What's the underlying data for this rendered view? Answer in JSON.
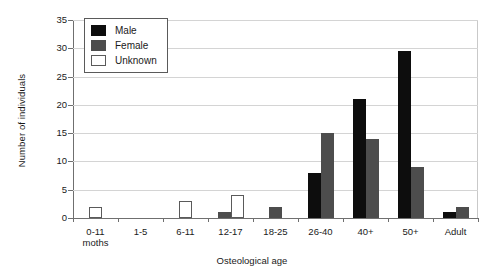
{
  "chart_data": {
    "type": "bar",
    "title": "",
    "xlabel": "Osteological age",
    "ylabel": "Number of individuals",
    "ylim": [
      0,
      35
    ],
    "ytick_step": 5,
    "yticks": [
      0,
      5,
      10,
      15,
      20,
      25,
      30,
      35
    ],
    "grid": "horizontal",
    "legend_position": "top-left-inside",
    "categories": [
      "0-11 moths",
      "1-5",
      "6-11",
      "12-17",
      "18-25",
      "26-40",
      "40+",
      "50+",
      "Adult"
    ],
    "category_lines": [
      [
        "0-11",
        "moths"
      ],
      [
        "1-5"
      ],
      [
        "6-11"
      ],
      [
        "12-17"
      ],
      [
        "18-25"
      ],
      [
        "26-40"
      ],
      [
        "40+"
      ],
      [
        "50+"
      ],
      [
        "Adult"
      ]
    ],
    "series": [
      {
        "name": "Male",
        "color": "#0d0d0d",
        "values": [
          0,
          0,
          0,
          0,
          0,
          8,
          21,
          29.5,
          1
        ]
      },
      {
        "name": "Female",
        "color": "#4d4d4d",
        "values": [
          0,
          0,
          0,
          1,
          2,
          15,
          14,
          9,
          2
        ]
      },
      {
        "name": "Unknown",
        "color": "#ffffff",
        "values": [
          2,
          0,
          3,
          4,
          0,
          0,
          0,
          0,
          0
        ]
      }
    ]
  },
  "legend": {
    "items": [
      {
        "label": "Male",
        "swatch": "male"
      },
      {
        "label": "Female",
        "swatch": "female"
      },
      {
        "label": "Unknown",
        "swatch": "unknown"
      }
    ]
  },
  "axis": {
    "y_title": "Number of individuals",
    "x_title": "Osteological age"
  }
}
